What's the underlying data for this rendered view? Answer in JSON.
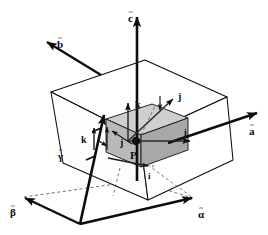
{
  "figure": {
    "type": "3d-line-diagram",
    "background": "#ffffff",
    "ink_color": "#0d0d0d",
    "inner_cube_fill": "#bdbdbd",
    "inner_cube_top_fill": "#d0d0d0",
    "inner_cube_side_fill": "#a9a9a9"
  },
  "labels": {
    "axis_c": {
      "text": "c",
      "accent": "~",
      "x": 128,
      "y": 10
    },
    "axis_b": {
      "text": "b",
      "accent": "~",
      "x": 57,
      "y": 36
    },
    "axis_a": {
      "text": "a",
      "accent": "~",
      "x": 249,
      "y": 123
    },
    "angle_alpha": {
      "text": "α",
      "accent": "~",
      "x": 198,
      "y": 206
    },
    "angle_beta": {
      "text": "β",
      "accent": "~",
      "x": 10,
      "y": 204
    },
    "angle_gamma": {
      "text": "γ",
      "accent": "~",
      "x": 58,
      "y": 148
    },
    "vec_k_outer": {
      "text": "k",
      "x": 81,
      "y": 135
    },
    "vec_k_inner": {
      "text": "k",
      "x": 135,
      "y": 100
    },
    "vec_j_upper": {
      "text": "j",
      "x": 178,
      "y": 92
    },
    "vec_j_inner": {
      "text": "j",
      "x": 120,
      "y": 138
    },
    "vec_i_right": {
      "text": "i",
      "x": 184,
      "y": 128
    },
    "vec_i_bottom": {
      "text": "i",
      "x": 148,
      "y": 172
    },
    "point_p": {
      "text": "P",
      "x": 130,
      "y": 150
    }
  },
  "geometry": {
    "outer_cell": {
      "name": "unit-cell-parallelepiped",
      "top_face": "51,92 145,60 227,97 140,137",
      "front_face": "51,92 140,137 148,200 63,163",
      "right_face": "140,137 227,97 233,160 148,200"
    },
    "inner_cube": {
      "name": "orthonormal-cube",
      "top_face": "106,119 152,104 188,118 141,135",
      "front_face": "106,119 141,135 141,167 106,152",
      "right_face": "141,135 188,118 188,150 141,167"
    },
    "vectors": [
      {
        "name": "c-axis-arrow",
        "from": "137,181",
        "to": "137,16"
      },
      {
        "name": "b-axis-arrow",
        "from": "98,73",
        "to": "46,41"
      },
      {
        "name": "a-axis-arrow",
        "from": "168,142",
        "to": "258,112"
      },
      {
        "name": "gamma-axis-arrow",
        "from": "80,224",
        "to": "105,113"
      },
      {
        "name": "alpha-edge-arrow",
        "from": "80,224",
        "to": "193,198"
      },
      {
        "name": "beta-edge-arrow",
        "from": "80,224",
        "to": "24,197"
      },
      {
        "name": "i-vector-arrow",
        "from": "124,141",
        "to": "189,141"
      },
      {
        "name": "k-vector-arrow",
        "from": "124,141",
        "to": "124,104"
      },
      {
        "name": "j-vector-arrow",
        "from": "124,141",
        "to": "172,98"
      }
    ]
  }
}
